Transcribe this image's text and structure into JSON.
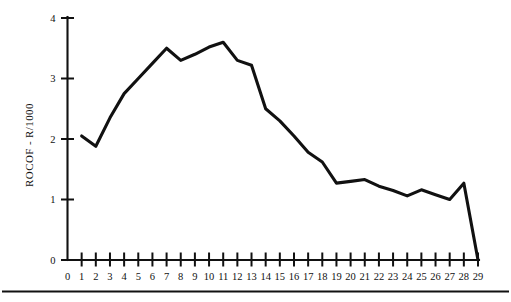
{
  "chart_data": {
    "type": "line",
    "title": "",
    "xlabel": "",
    "ylabel": "ROCOF - R/1000",
    "xlim": [
      0,
      29
    ],
    "ylim": [
      0,
      4
    ],
    "grid": false,
    "legend": null,
    "x_ticks": [
      "0",
      "1",
      "2",
      "3",
      "4",
      "5",
      "6",
      "7",
      "8",
      "9",
      "10",
      "11",
      "12",
      "13",
      "14",
      "15",
      "16",
      "17",
      "18",
      "19",
      "20",
      "21",
      "22",
      "23",
      "24",
      "25",
      "26",
      "27",
      "28",
      "29"
    ],
    "y_ticks": [
      "0",
      "1",
      "2",
      "3",
      "4"
    ],
    "series": [
      {
        "name": "ROCOF",
        "color": "#111111",
        "x": [
          1,
          2,
          3,
          4,
          5,
          6,
          7,
          8,
          9,
          10,
          11,
          12,
          13,
          14,
          15,
          16,
          17,
          18,
          19,
          20,
          21,
          22,
          23,
          24,
          25,
          26,
          27,
          28,
          29
        ],
        "values": [
          2.05,
          1.88,
          2.35,
          2.75,
          3.0,
          3.25,
          3.5,
          3.3,
          3.4,
          3.52,
          3.6,
          3.3,
          3.22,
          2.5,
          2.3,
          2.05,
          1.78,
          1.62,
          1.27,
          1.3,
          1.33,
          1.22,
          1.15,
          1.06,
          1.16,
          1.08,
          1.0,
          1.27,
          0.0
        ]
      }
    ]
  }
}
